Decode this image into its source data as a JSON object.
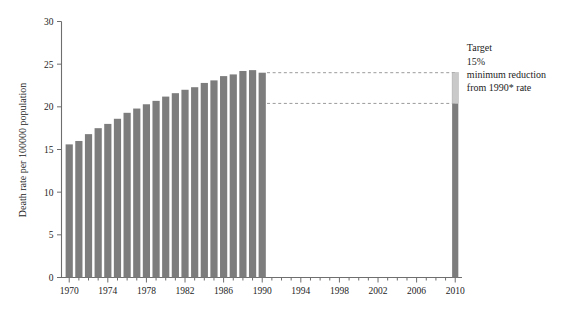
{
  "chart_data": {
    "type": "bar",
    "title": "",
    "subtitle": "",
    "xlabel": "",
    "ylabel": "Death rate per 100000 population",
    "ylim": [
      0,
      30
    ],
    "ytick_values": [
      0,
      5,
      10,
      15,
      20,
      25,
      30
    ],
    "ytick_labels": [
      "0",
      "5",
      "10",
      "15",
      "20",
      "25",
      "30"
    ],
    "xlim": [
      1969.4,
      2010.6
    ],
    "xtick_labels": [
      "1970",
      "1974",
      "1978",
      "1982",
      "1986",
      "1990",
      "1994",
      "1998",
      "2002",
      "2006",
      "2010"
    ],
    "xtick_values": [
      1970,
      1974,
      1978,
      1982,
      1986,
      1990,
      1994,
      1998,
      2002,
      2006,
      2010
    ],
    "xtick_minor_values": [
      1971,
      1972,
      1973,
      1975,
      1976,
      1977,
      1979,
      1980,
      1981,
      1983,
      1984,
      1985,
      1987,
      1988,
      1989,
      1991,
      1992,
      1993,
      1995,
      1996,
      1997,
      1999,
      2000,
      2001,
      2003,
      2004,
      2005,
      2007,
      2008,
      2009
    ],
    "grid": false,
    "legend": null,
    "categories": [
      1970,
      1971,
      1972,
      1973,
      1974,
      1975,
      1976,
      1977,
      1978,
      1979,
      1980,
      1981,
      1982,
      1983,
      1984,
      1985,
      1986,
      1987,
      1988,
      1989,
      1990
    ],
    "values": [
      15.6,
      16.0,
      16.8,
      17.5,
      18.0,
      18.6,
      19.3,
      19.8,
      20.3,
      20.7,
      21.2,
      21.6,
      22.0,
      22.3,
      22.8,
      23.1,
      23.6,
      23.8,
      24.2,
      24.3,
      24.0
    ],
    "series": [
      {
        "name": "Death rate per 100000 population",
        "values": [
          15.6,
          16.0,
          16.8,
          17.5,
          18.0,
          18.6,
          19.3,
          19.8,
          20.3,
          20.7,
          21.2,
          21.6,
          22.0,
          22.3,
          22.8,
          23.1,
          23.6,
          23.8,
          24.2,
          24.3,
          24.0
        ],
        "color": "#7d7d7d"
      }
    ],
    "target_bar": {
      "x": 2010,
      "label": "Target",
      "base_value": 0,
      "lower_segment_top": 20.4,
      "upper_segment_top": 24.0,
      "lower_color": "#7d7d7d",
      "upper_color": "#c9c9c9"
    },
    "guide_lines": [
      {
        "value": 24.0,
        "from_x": 1990.5,
        "to_x": 2010.2,
        "style": "dashed"
      },
      {
        "value": 20.4,
        "from_x": 1990.5,
        "to_x": 2010.2,
        "style": "dashed"
      }
    ],
    "annotations": [
      {
        "lines": [
          "Target",
          "15%",
          "minimum reduction",
          "from 1990* rate"
        ],
        "at_x": 2011,
        "at_value": 26.5
      }
    ]
  },
  "annotation": {
    "line1": "Target",
    "line2": "15%",
    "line3": "minimum reduction",
    "line4": "from 1990* rate"
  },
  "colors": {
    "bar": "#7d7d7d",
    "target_upper": "#c9c9c9",
    "axis": "#6e6e6e",
    "guide": "#9a9a9a",
    "background": "#ffffff"
  }
}
